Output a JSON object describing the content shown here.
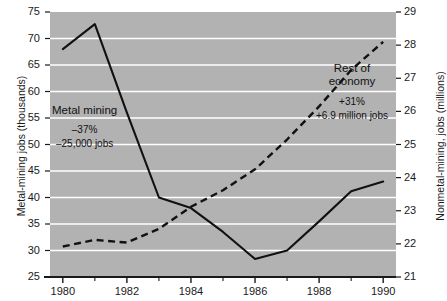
{
  "chart_data": {
    "type": "line",
    "title": "",
    "xlabel": "",
    "grid": "horizontal",
    "legend": "annotations",
    "x": [
      1980,
      1981,
      1982,
      1983,
      1984,
      1985,
      1986,
      1987,
      1988,
      1989,
      1990
    ],
    "xlim": [
      1979.6,
      1990.4
    ],
    "xticks_major": [
      "1980",
      "1982",
      "1984",
      "1986",
      "1988",
      "1990"
    ],
    "xticks_major_values": [
      1980,
      1982,
      1984,
      1986,
      1988,
      1990
    ],
    "xticks_minor_values": [
      1981,
      1983,
      1985,
      1987,
      1989
    ],
    "left_axis": {
      "label": "Metal-mining jobs (thousands)",
      "lim": [
        25,
        75
      ],
      "ticks": [
        25,
        30,
        35,
        40,
        45,
        50,
        55,
        60,
        65,
        70,
        75
      ],
      "tick_labels": [
        "25",
        "30",
        "35",
        "40",
        "45",
        "50",
        "55",
        "60",
        "65",
        "70",
        "75"
      ]
    },
    "right_axis": {
      "label": "Nonmetal-mining, jobs (millions)",
      "lim": [
        21,
        29
      ],
      "ticks": [
        21,
        22,
        23,
        24,
        25,
        26,
        27,
        28,
        29
      ],
      "tick_labels": [
        "21",
        "22",
        "23",
        "24",
        "25",
        "26",
        "27",
        "28",
        "29"
      ]
    },
    "series": [
      {
        "name": "Metal mining",
        "axis": "left",
        "style": "solid",
        "color": "#111111",
        "values": [
          68.0,
          72.7,
          56.0,
          40.0,
          38.0,
          33.5,
          28.4,
          30.0,
          35.5,
          41.2,
          43.0
        ]
      },
      {
        "name": "Rest of economy",
        "axis": "right",
        "style": "dashed",
        "color": "#111111",
        "values": [
          21.92,
          22.12,
          22.04,
          22.45,
          23.12,
          23.62,
          24.25,
          25.15,
          26.15,
          27.25,
          28.1
        ]
      }
    ],
    "annotations": [
      {
        "id": "metal-mining",
        "title": "Metal mining",
        "line1": "–37%",
        "line2": "–25,000 jobs"
      },
      {
        "id": "rest-of-economy",
        "title_line1": "Rest of",
        "title_line2": "economy",
        "line1": "+31%",
        "line2": "+6.9 million jobs"
      }
    ],
    "colors": {
      "plot_background": "#b2b2b2",
      "gridline": "#ffffff",
      "axis": "#1a1a1a",
      "text": "#1a1a1a",
      "page_background": "#ffffff"
    }
  }
}
